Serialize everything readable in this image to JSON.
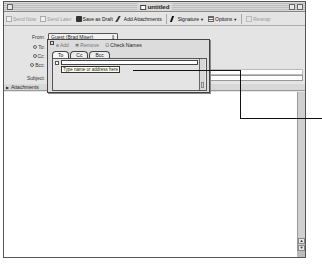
{
  "window": {
    "title": "untitled"
  },
  "toolbar": {
    "send_now": "Send Now",
    "send_later": "Send Later",
    "save_as_draft": "Save as Draft",
    "add_attachments": "Add Attachments",
    "signature": "Signature",
    "options": "Options",
    "rewrap": "Rewrap"
  },
  "header": {
    "from_label": "From:",
    "from_value": "Guest (Brad Miser)",
    "to_label": "To:",
    "cc_label": "Cc:",
    "bcc_label": "Bcc:",
    "subject_label": "Subject:",
    "attachments_label": "Attachments"
  },
  "address_popup": {
    "add_label": "Add",
    "remove_label": "Remove",
    "check_names_label": "Check Names",
    "tabs": [
      {
        "label": "To",
        "active": true
      },
      {
        "label": "Cc",
        "active": false
      },
      {
        "label": "Bcc",
        "active": false
      }
    ],
    "input_value": "",
    "tooltip": "Type name or address here"
  },
  "colors": {
    "window_bg": "#e6e6e6",
    "body_bg": "#ffffff",
    "callout_line": "#111111"
  }
}
